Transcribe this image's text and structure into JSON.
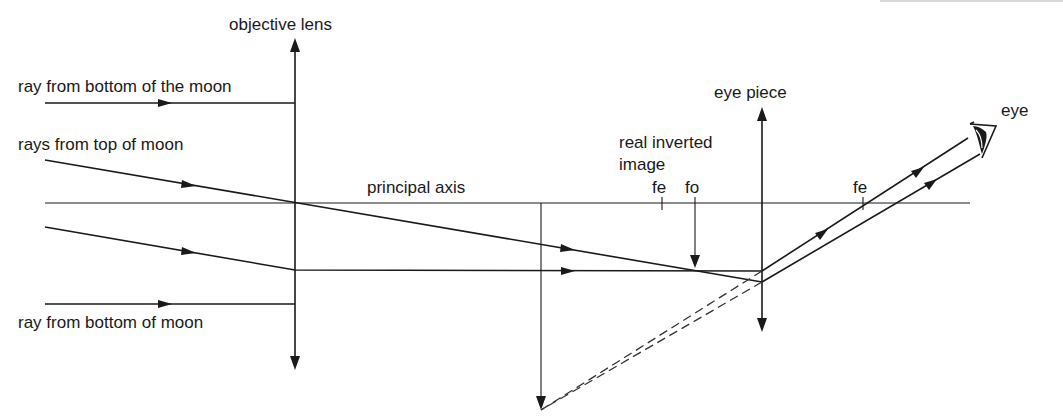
{
  "diagram": {
    "labels": {
      "objective_lens": "objective lens",
      "eye_piece": "eye piece",
      "eye": "eye",
      "ray_bottom_top": "ray from bottom of the moon",
      "rays_top": "rays from top of moon",
      "ray_bottom_low": "ray from bottom of moon",
      "principal_axis": "principal axis",
      "real_inverted_line1": "real inverted",
      "real_inverted_line2": "image",
      "fe_left": "fe",
      "fo": "fo",
      "fe_right": "fe"
    },
    "elements": {
      "objective_lens_x": 295,
      "eye_piece_x": 762,
      "principal_axis_y": 203,
      "fe_left_x": 662,
      "fo_x": 695,
      "fe_right_x": 863,
      "virtual_image_x": 541
    },
    "colors": {
      "line": "#1a1a1a",
      "background": "#ffffff"
    }
  }
}
